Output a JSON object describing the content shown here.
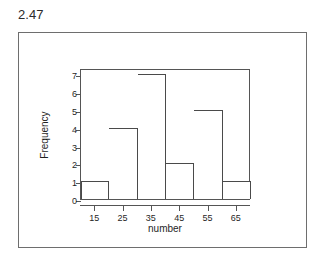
{
  "figure": {
    "exercise_number": "2.47"
  },
  "chart_data": {
    "type": "bar",
    "title": "",
    "subtitle": "",
    "xlabel": "number",
    "ylabel": "Frequency",
    "categories": [
      "15",
      "25",
      "35",
      "45",
      "55",
      "65"
    ],
    "values": [
      1,
      4,
      7,
      2,
      5,
      1
    ],
    "xtick_labels": [
      "15",
      "25",
      "35",
      "45",
      "55",
      "65"
    ],
    "ytick_labels": [
      "0",
      "1",
      "2",
      "3",
      "4",
      "5",
      "6",
      "7"
    ],
    "ytick_values": [
      0,
      1,
      2,
      3,
      4,
      5,
      6,
      7
    ],
    "ylim": [
      0,
      7.35
    ],
    "xlim": [
      10,
      70
    ],
    "bin_width": 10,
    "bin_edges": [
      10,
      20,
      30,
      40,
      50,
      60,
      70
    ],
    "grid": false,
    "legend": false,
    "legend_position": "none",
    "bar_fill_color": "#ffffff",
    "bar_edge_color": "#4a4a4a",
    "axis_color": "#555555",
    "background_color": "#ffffff"
  }
}
